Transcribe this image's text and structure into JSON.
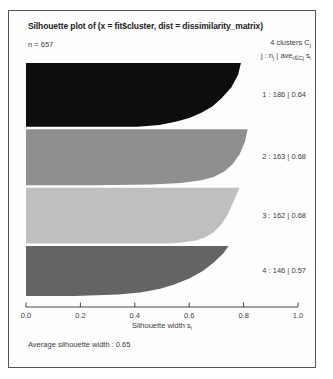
{
  "page": {
    "title": "Silhouette plot of (x = fit$cluster, dist = dissimilarity_matrix)",
    "n_label": "n = 657",
    "header_right": {
      "line1_main": "4  clusters  C",
      "line1_sub": "j",
      "line2_parts": [
        "j :  n",
        "j",
        " | ave",
        "i∈Cj",
        " s",
        "i"
      ]
    },
    "xlabel_main": "Silhouette width s",
    "xlabel_sub": "i",
    "footer_avg": "Average silhouette width :  0.65"
  },
  "colors": {
    "frame": "#555555",
    "axis": "#444444",
    "text": "#3c3c3c",
    "title": "#1c1c1c",
    "background": "#ffffff"
  },
  "chart_data": {
    "type": "bar",
    "subtype": "silhouette-plot",
    "title": "Silhouette plot of (x = fit$cluster, dist = dissimilarity_matrix)",
    "n_total": 657,
    "k_clusters": 4,
    "average_silhouette_width": 0.65,
    "xlabel": "Silhouette width si",
    "xlim": [
      0,
      1
    ],
    "x_ticks": [
      "0.0",
      "0.2",
      "0.4",
      "0.6",
      "0.8",
      "1.0"
    ],
    "grid": false,
    "legend": "none",
    "clusters": [
      {
        "j": 1,
        "n": 186,
        "ave": 0.64,
        "color": "#0d0d0d",
        "label": "1 :  186 | 0.64",
        "max_width": 0.79,
        "min_width": 0.41,
        "width_profile": [
          [
            0,
            0.79
          ],
          [
            0.18,
            0.78
          ],
          [
            0.38,
            0.755
          ],
          [
            0.55,
            0.72
          ],
          [
            0.68,
            0.685
          ],
          [
            0.78,
            0.645
          ],
          [
            0.86,
            0.6
          ],
          [
            0.92,
            0.55
          ],
          [
            0.97,
            0.49
          ],
          [
            1,
            0.41
          ]
        ]
      },
      {
        "j": 2,
        "n": 163,
        "ave": 0.68,
        "color": "#8f8f8f",
        "label": "2 :  163 | 0.68",
        "max_width": 0.82,
        "min_width": 0.25,
        "width_profile": [
          [
            0,
            0.815
          ],
          [
            0.22,
            0.805
          ],
          [
            0.45,
            0.785
          ],
          [
            0.62,
            0.76
          ],
          [
            0.75,
            0.73
          ],
          [
            0.85,
            0.69
          ],
          [
            0.91,
            0.645
          ],
          [
            0.96,
            0.57
          ],
          [
            0.985,
            0.46
          ],
          [
            1,
            0.25
          ]
        ]
      },
      {
        "j": 3,
        "n": 162,
        "ave": 0.68,
        "color": "#bfbfbf",
        "label": "3 :  162 | 0.68",
        "max_width": 0.79,
        "min_width": 0.53,
        "width_profile": [
          [
            0,
            0.785
          ],
          [
            0.22,
            0.765
          ],
          [
            0.45,
            0.745
          ],
          [
            0.65,
            0.72
          ],
          [
            0.8,
            0.69
          ],
          [
            0.89,
            0.66
          ],
          [
            0.95,
            0.625
          ],
          [
            0.985,
            0.575
          ],
          [
            1,
            0.53
          ]
        ]
      },
      {
        "j": 4,
        "n": 146,
        "ave": 0.57,
        "color": "#646464",
        "label": "4 :  146 | 0.57",
        "max_width": 0.75,
        "min_width": 0.18,
        "width_profile": [
          [
            0,
            0.745
          ],
          [
            0.15,
            0.725
          ],
          [
            0.33,
            0.69
          ],
          [
            0.5,
            0.65
          ],
          [
            0.65,
            0.6
          ],
          [
            0.77,
            0.545
          ],
          [
            0.86,
            0.49
          ],
          [
            0.93,
            0.42
          ],
          [
            0.97,
            0.34
          ],
          [
            1,
            0.18
          ]
        ]
      }
    ],
    "layout": {
      "x_axis_px": {
        "x0": 26,
        "x1": 298,
        "y": 307
      },
      "plot_top_px": 63,
      "plot_bottom_px": 296
    }
  }
}
